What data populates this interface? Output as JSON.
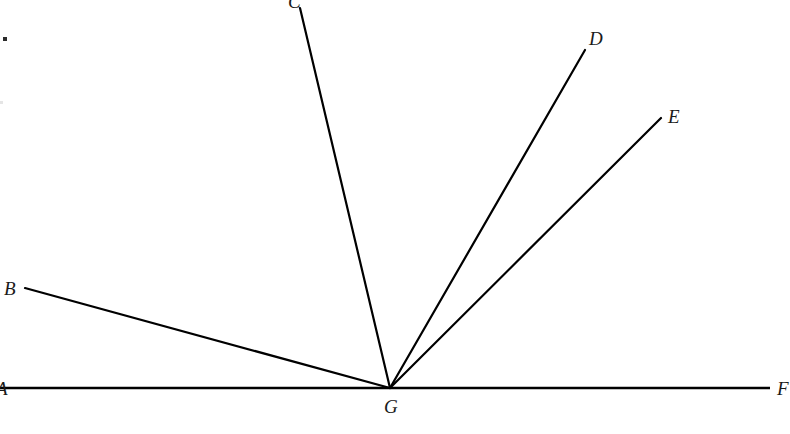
{
  "figure": {
    "kind": "geometry-diagram",
    "background_color": "#ffffff",
    "stroke_color": "#000000",
    "label_color": "#1a1a1a",
    "stroke_width": 2.2,
    "baseline_stroke_width": 2.6,
    "width": 790,
    "height": 434
  },
  "vertex": {
    "name": "G",
    "x": 390,
    "y": 388,
    "label_x": 384,
    "label_y": 397
  },
  "baseline": {
    "name": "AF",
    "x1": 0,
    "y1": 388,
    "x2": 770,
    "y2": 388,
    "left_label": "A",
    "left_label_x": -4,
    "left_label_y": 379,
    "right_label": "F",
    "right_label_x": 777,
    "right_label_y": 379
  },
  "rays": [
    {
      "name": "GB",
      "label": "B",
      "x1": 390,
      "y1": 388,
      "x2": 25,
      "y2": 288,
      "label_x": 4,
      "label_y": 279
    },
    {
      "name": "GC",
      "label": "C",
      "x1": 390,
      "y1": 388,
      "x2": 300,
      "y2": 8,
      "label_x": 288,
      "label_y": -8
    },
    {
      "name": "GD",
      "label": "D",
      "x1": 390,
      "y1": 388,
      "x2": 585,
      "y2": 50,
      "label_x": 589,
      "label_y": 29
    },
    {
      "name": "GE",
      "label": "E",
      "x1": 390,
      "y1": 388,
      "x2": 661,
      "y2": 118,
      "label_x": 668,
      "label_y": 107
    }
  ],
  "artifacts": [
    {
      "name": "speck",
      "x": 3,
      "y": 37,
      "w": 4,
      "h": 4
    },
    {
      "name": "faint-speck",
      "x": 0,
      "y": 101,
      "w": 3,
      "h": 3
    }
  ],
  "chart_data": {
    "type": "scatter",
    "title": "",
    "xlabel": "",
    "ylabel": "",
    "grid": false,
    "legend": "none",
    "points": [
      {
        "label": "A",
        "x": 0,
        "y": 388
      },
      {
        "label": "B",
        "x": 25,
        "y": 288
      },
      {
        "label": "C",
        "x": 300,
        "y": 8
      },
      {
        "label": "D",
        "x": 585,
        "y": 50
      },
      {
        "label": "E",
        "x": 661,
        "y": 118
      },
      {
        "label": "F",
        "x": 770,
        "y": 388
      },
      {
        "label": "G",
        "x": 390,
        "y": 388
      }
    ],
    "segments": [
      {
        "from": "A",
        "to": "F",
        "through": "G"
      },
      {
        "from": "G",
        "to": "B"
      },
      {
        "from": "G",
        "to": "C"
      },
      {
        "from": "G",
        "to": "D"
      },
      {
        "from": "G",
        "to": "E"
      }
    ]
  }
}
